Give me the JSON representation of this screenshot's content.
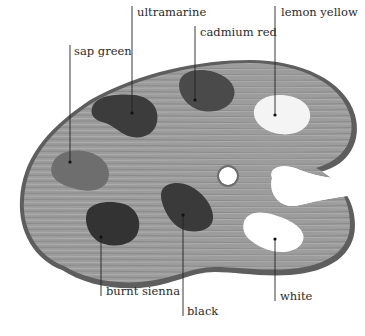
{
  "diagram": {
    "labels": [
      {
        "id": "ultramarine",
        "text": "ultramarine",
        "x": 137,
        "y": 7,
        "line": {
          "x": 132,
          "y1": 6,
          "y2": 113
        }
      },
      {
        "id": "cadmium-red",
        "text": "cadmium red",
        "x": 200,
        "y": 27,
        "line": {
          "x": 195,
          "y1": 26,
          "y2": 100
        }
      },
      {
        "id": "lemon-yellow",
        "text": "lemon yellow",
        "x": 281,
        "y": 7,
        "line": {
          "x": 275,
          "y1": 6,
          "y2": 115
        }
      },
      {
        "id": "sap-green",
        "text": "sap green",
        "x": 74,
        "y": 46,
        "line": {
          "x": 70,
          "y1": 45,
          "y2": 162
        }
      },
      {
        "id": "burnt-sienna",
        "text": "burnt sienna",
        "x": 106,
        "y": 286,
        "line": {
          "x": 101,
          "y1": 237,
          "y2": 296
        }
      },
      {
        "id": "black",
        "text": "black",
        "x": 187,
        "y": 306,
        "line": {
          "x": 183,
          "y1": 215,
          "y2": 316
        }
      },
      {
        "id": "white",
        "text": "white",
        "x": 280,
        "y": 291,
        "line": {
          "x": 275,
          "y1": 239,
          "y2": 301
        }
      }
    ],
    "colors": {
      "background": "#ffffff",
      "wood": "#9a9a9a",
      "wood_dark": "#7a7a7a",
      "rim": "#5e5e5e",
      "ultramarine": "#3c3c3c",
      "cadmium_red": "#4a4a4a",
      "lemon_yellow": "#f2f2f2",
      "sap_green": "#6e6e6e",
      "burnt_sienna": "#333333",
      "black": "#3a3a3a",
      "white": "#ffffff",
      "leader_line": "#222222",
      "label_text": "#2a2a2a"
    }
  }
}
